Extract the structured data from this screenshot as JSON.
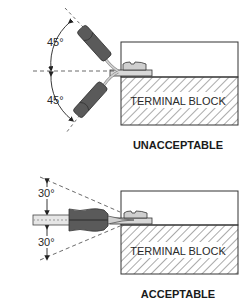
{
  "diagram": {
    "colors": {
      "line": "#333333",
      "handle": "#5a5a5a",
      "handle_dark": "#3c3c3c",
      "shaft": "#c8c8c8",
      "screw": "#cfcfcf",
      "hatch": "#555555"
    },
    "panels": [
      {
        "id": "unacceptable",
        "caption": "UNACCEPTABLE",
        "block_label": "TERMINAL BLOCK",
        "angle_top": "45°",
        "angle_bottom": "45°"
      },
      {
        "id": "acceptable",
        "caption": "ACCEPTABLE",
        "block_label": "TERMINAL BLOCK",
        "angle_top": "30°",
        "angle_bottom": "30°"
      }
    ]
  }
}
